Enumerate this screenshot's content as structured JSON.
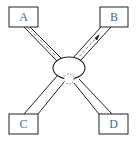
{
  "diagram": {
    "nodes": [
      {
        "id": "A",
        "label": "A"
      },
      {
        "id": "B",
        "label": "B"
      },
      {
        "id": "C",
        "label": "C"
      },
      {
        "id": "D",
        "label": "D"
      }
    ],
    "center": {
      "shape": "ellipse",
      "label": ""
    },
    "edges": [
      {
        "from": "A",
        "to": "center",
        "style": "dash-dot path"
      },
      {
        "from": "center",
        "to": "B",
        "style": "dashed path with arrow toward B"
      },
      {
        "from": "C",
        "to": "center",
        "style": "double line"
      },
      {
        "from": "D",
        "to": "center",
        "style": "double line"
      }
    ],
    "colors": {
      "line": "#222222",
      "label": "#3a6ea5",
      "background": "#ffffff"
    }
  }
}
